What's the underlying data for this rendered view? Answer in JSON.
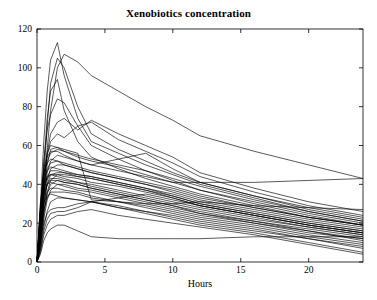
{
  "chart_data": {
    "type": "line",
    "title": "Xenobiotics concentration",
    "xlabel": "Hours",
    "ylabel": "",
    "xlim": [
      0,
      24
    ],
    "ylim": [
      0,
      120
    ],
    "xticks": [
      0,
      5,
      10,
      15,
      20
    ],
    "yticks": [
      0,
      20,
      40,
      60,
      80,
      100,
      120
    ],
    "grid": false,
    "legend": "none",
    "line_color": "#000000",
    "background_color": "#ffffff",
    "axis_color": "#000000",
    "x": [
      0,
      0.25,
      0.5,
      0.75,
      1,
      1.5,
      2,
      3,
      4,
      6,
      8,
      10,
      12,
      16,
      20,
      24
    ],
    "series": [
      {
        "name": "subject-01",
        "values": [
          0,
          30,
          62,
          88,
          104,
          113,
          96,
          74,
          62,
          56,
          50,
          45,
          40,
          33,
          26,
          21
        ]
      },
      {
        "name": "subject-02",
        "values": [
          0,
          18,
          44,
          70,
          92,
          105,
          100,
          80,
          66,
          58,
          52,
          46,
          41,
          34,
          27,
          22
        ]
      },
      {
        "name": "subject-03",
        "values": [
          0,
          12,
          34,
          58,
          78,
          100,
          107,
          103,
          96,
          88,
          80,
          73,
          65,
          57,
          50,
          43
        ]
      },
      {
        "name": "subject-04",
        "values": [
          0,
          22,
          50,
          74,
          88,
          94,
          78,
          62,
          54,
          48,
          43,
          39,
          35,
          29,
          23,
          19
        ]
      },
      {
        "name": "subject-05",
        "values": [
          0,
          26,
          52,
          68,
          76,
          84,
          82,
          70,
          60,
          53,
          47,
          42,
          37,
          30,
          24,
          19
        ]
      },
      {
        "name": "subject-06",
        "values": [
          0,
          16,
          38,
          56,
          66,
          72,
          74,
          68,
          73,
          66,
          60,
          54,
          46,
          38,
          31,
          26
        ]
      },
      {
        "name": "subject-07",
        "values": [
          0,
          20,
          42,
          55,
          62,
          66,
          64,
          70,
          72,
          63,
          57,
          51,
          44,
          36,
          29,
          24
        ]
      },
      {
        "name": "subject-08",
        "values": [
          0,
          28,
          48,
          56,
          60,
          59,
          57,
          55,
          53,
          50,
          47,
          43,
          39,
          32,
          26,
          21
        ]
      },
      {
        "name": "subject-09",
        "values": [
          0,
          24,
          44,
          52,
          56,
          58,
          57,
          54,
          52,
          49,
          45,
          41,
          37,
          31,
          25,
          20
        ]
      },
      {
        "name": "subject-10",
        "values": [
          0,
          14,
          34,
          46,
          52,
          55,
          54,
          52,
          50,
          53,
          56,
          48,
          41,
          34,
          28,
          23
        ]
      },
      {
        "name": "subject-11",
        "values": [
          0,
          30,
          46,
          51,
          53,
          52,
          50,
          48,
          46,
          43,
          40,
          37,
          33,
          28,
          23,
          19
        ]
      },
      {
        "name": "subject-12",
        "values": [
          0,
          21,
          40,
          48,
          51,
          52,
          51,
          49,
          47,
          44,
          41,
          38,
          34,
          28,
          23,
          19
        ]
      },
      {
        "name": "subject-13",
        "values": [
          0,
          10,
          28,
          42,
          48,
          50,
          50,
          48,
          46,
          43,
          40,
          36,
          32,
          27,
          22,
          18
        ]
      },
      {
        "name": "subject-14",
        "values": [
          0,
          25,
          42,
          47,
          49,
          48,
          47,
          45,
          44,
          41,
          38,
          35,
          31,
          26,
          21,
          17
        ]
      },
      {
        "name": "subject-15",
        "values": [
          0,
          18,
          36,
          44,
          47,
          47,
          46,
          44,
          43,
          40,
          37,
          34,
          30,
          25,
          20,
          16
        ]
      },
      {
        "name": "subject-16",
        "values": [
          0,
          12,
          30,
          40,
          45,
          46,
          46,
          45,
          44,
          41,
          38,
          34,
          30,
          25,
          20,
          16
        ]
      },
      {
        "name": "subject-17",
        "values": [
          0,
          23,
          38,
          43,
          45,
          45,
          44,
          43,
          41,
          39,
          36,
          33,
          29,
          24,
          19,
          15
        ]
      },
      {
        "name": "subject-18",
        "values": [
          0,
          8,
          24,
          36,
          42,
          45,
          45,
          44,
          43,
          40,
          37,
          33,
          29,
          24,
          19,
          15
        ]
      },
      {
        "name": "subject-19",
        "values": [
          0,
          26,
          40,
          44,
          45,
          44,
          43,
          41,
          40,
          37,
          34,
          31,
          28,
          23,
          18,
          14
        ]
      },
      {
        "name": "subject-20",
        "values": [
          0,
          15,
          32,
          40,
          43,
          43,
          42,
          41,
          39,
          36,
          33,
          30,
          27,
          22,
          18,
          14
        ]
      },
      {
        "name": "subject-21",
        "values": [
          0,
          19,
          34,
          40,
          42,
          42,
          41,
          40,
          38,
          35,
          32,
          29,
          26,
          21,
          17,
          13
        ]
      },
      {
        "name": "subject-22",
        "values": [
          0,
          11,
          26,
          35,
          40,
          42,
          41,
          40,
          38,
          35,
          32,
          29,
          25,
          21,
          16,
          12
        ]
      },
      {
        "name": "subject-23",
        "values": [
          0,
          22,
          36,
          40,
          41,
          40,
          39,
          37,
          36,
          33,
          30,
          27,
          24,
          20,
          15,
          12
        ]
      },
      {
        "name": "subject-24",
        "values": [
          0,
          9,
          22,
          32,
          37,
          40,
          40,
          38,
          37,
          34,
          31,
          28,
          25,
          20,
          16,
          11
        ]
      },
      {
        "name": "subject-25",
        "values": [
          0,
          17,
          30,
          36,
          38,
          38,
          37,
          36,
          34,
          31,
          29,
          26,
          23,
          19,
          14,
          10
        ]
      },
      {
        "name": "subject-26",
        "values": [
          0,
          13,
          27,
          33,
          36,
          36,
          36,
          35,
          33,
          31,
          28,
          25,
          22,
          18,
          13,
          9
        ]
      },
      {
        "name": "subject-27",
        "values": [
          0,
          20,
          31,
          34,
          35,
          34,
          33,
          32,
          31,
          28,
          26,
          23,
          20,
          16,
          12,
          8
        ]
      },
      {
        "name": "subject-28",
        "values": [
          0,
          7,
          18,
          26,
          31,
          33,
          33,
          32,
          31,
          29,
          26,
          24,
          21,
          17,
          12,
          7
        ]
      },
      {
        "name": "subject-29",
        "values": [
          0,
          10,
          20,
          25,
          27,
          28,
          28,
          30,
          31,
          28,
          25,
          22,
          19,
          15,
          10,
          5
        ]
      },
      {
        "name": "subject-30",
        "values": [
          0,
          5,
          14,
          19,
          22,
          24,
          24,
          26,
          27,
          24,
          22,
          20,
          18,
          14,
          9,
          4
        ]
      },
      {
        "name": "subject-31",
        "values": [
          0,
          6,
          16,
          22,
          25,
          26,
          26,
          28,
          31,
          33,
          35,
          32,
          29,
          24,
          19,
          15
        ]
      },
      {
        "name": "subject-32",
        "values": [
          0,
          4,
          11,
          15,
          17,
          19,
          19,
          16,
          13,
          12,
          12,
          12,
          12,
          13,
          13,
          13
        ]
      },
      {
        "name": "subject-33",
        "values": [
          0,
          16,
          35,
          50,
          58,
          59,
          58,
          56,
          32,
          31,
          30,
          30,
          31,
          29,
          28,
          27
        ]
      },
      {
        "name": "subject-34",
        "values": [
          0,
          27,
          46,
          54,
          57,
          57,
          55,
          52,
          50,
          47,
          44,
          41,
          41,
          41,
          42,
          43
        ]
      }
    ]
  }
}
